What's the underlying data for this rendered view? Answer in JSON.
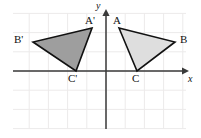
{
  "figure": {
    "background_color": "#ffffff",
    "grid": {
      "visible": true,
      "color": "#eceaea",
      "cell_size_px": 19.2,
      "x_min_px": 13,
      "x_max_px": 186,
      "y_min_px": 13,
      "y_max_px": 129
    },
    "axes": {
      "color": "#3a3a3a",
      "x_axis": {
        "label": "x",
        "y_px": 71,
        "start_px": 13,
        "end_px": 189,
        "arrow": "right"
      },
      "y_axis": {
        "label": "y",
        "x_px": 106,
        "start_px": 129,
        "end_px": 9,
        "arrow": "up"
      },
      "origin_px": {
        "x": 106,
        "y": 71
      }
    },
    "shapes": [
      {
        "name": "triangle-image-prime",
        "fill": "#9e9e9e",
        "stroke": "#111111",
        "stroke_width": 1.6,
        "vertices": [
          {
            "label": "A'",
            "x_px": 92,
            "y_px": 28
          },
          {
            "label": "B'",
            "x_px": 33,
            "y_px": 42
          },
          {
            "label": "C'",
            "x_px": 76,
            "y_px": 71
          }
        ]
      },
      {
        "name": "triangle-preimage",
        "fill": "#dedede",
        "stroke": "#111111",
        "stroke_width": 1.6,
        "vertices": [
          {
            "label": "A",
            "x_px": 119,
            "y_px": 28
          },
          {
            "label": "B",
            "x_px": 175,
            "y_px": 42
          },
          {
            "label": "C",
            "x_px": 137,
            "y_px": 71
          }
        ]
      }
    ],
    "labels": [
      {
        "name": "vertex-label-a-prime",
        "text": "A'",
        "x_px": 85,
        "y_px": 15
      },
      {
        "name": "vertex-label-b-prime",
        "text": "B'",
        "x_px": 14,
        "y_px": 34
      },
      {
        "name": "vertex-label-c-prime",
        "text": "C'",
        "x_px": 68,
        "y_px": 73
      },
      {
        "name": "vertex-label-a",
        "text": "A",
        "x_px": 113,
        "y_px": 15
      },
      {
        "name": "vertex-label-b",
        "text": "B",
        "x_px": 180,
        "y_px": 34
      },
      {
        "name": "vertex-label-c",
        "text": "C",
        "x_px": 132,
        "y_px": 73
      },
      {
        "name": "axis-label-y",
        "text": "y",
        "x_px": 96,
        "y_px": 1
      },
      {
        "name": "axis-label-x",
        "text": "x",
        "x_px": 188,
        "y_px": 74
      }
    ]
  }
}
